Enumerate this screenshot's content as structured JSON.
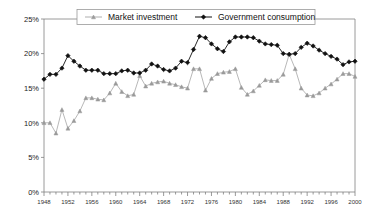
{
  "chart_data": {
    "type": "line",
    "title": "",
    "xlabel": "",
    "ylabel": "",
    "ylim": [
      0,
      25
    ],
    "xlim": [
      1948,
      2000
    ],
    "grid": false,
    "legend_position": "top-center",
    "ytick_labels": [
      "0%",
      "5%",
      "10%",
      "15%",
      "20%",
      "25%"
    ],
    "ytick_values": [
      0,
      5,
      10,
      15,
      20,
      25
    ],
    "xtick_labels": [
      "1948",
      "1952",
      "1956",
      "1960",
      "1964",
      "1968",
      "1972",
      "1976",
      "1980",
      "1984",
      "1988",
      "1992",
      "1996",
      "2000"
    ],
    "xtick_values": [
      1948,
      1952,
      1956,
      1960,
      1964,
      1968,
      1972,
      1976,
      1980,
      1984,
      1988,
      1992,
      1996,
      2000
    ],
    "x": [
      1948,
      1949,
      1950,
      1951,
      1952,
      1953,
      1954,
      1955,
      1956,
      1957,
      1958,
      1959,
      1960,
      1961,
      1962,
      1963,
      1964,
      1965,
      1966,
      1967,
      1968,
      1969,
      1970,
      1971,
      1972,
      1973,
      1974,
      1975,
      1976,
      1977,
      1978,
      1979,
      1980,
      1981,
      1982,
      1983,
      1984,
      1985,
      1986,
      1987,
      1988,
      1989,
      1990,
      1991,
      1992,
      1993,
      1994,
      1995,
      1996,
      1997,
      1998,
      1999,
      2000
    ],
    "series": [
      {
        "name": "Market investment",
        "marker": "triangle",
        "color": "#9a9a9a",
        "values": [
          10.0,
          10.0,
          8.5,
          11.9,
          9.2,
          10.3,
          11.7,
          13.6,
          13.6,
          13.4,
          13.3,
          14.3,
          15.7,
          14.5,
          13.9,
          14.1,
          16.8,
          15.3,
          15.7,
          15.9,
          16.0,
          15.7,
          15.5,
          15.2,
          15.0,
          17.8,
          17.8,
          14.7,
          16.4,
          17.1,
          17.3,
          17.4,
          17.8,
          15.1,
          14.1,
          14.6,
          15.4,
          16.2,
          16.1,
          16.1,
          17.0,
          19.9,
          17.8,
          15.0,
          14.0,
          13.9,
          14.3,
          15.0,
          15.6,
          16.3,
          17.1,
          17.1,
          16.7
        ]
      },
      {
        "name": "Government consumption",
        "marker": "diamond",
        "color": "#111111",
        "values": [
          16.3,
          17.0,
          17.0,
          17.9,
          19.7,
          18.9,
          18.2,
          17.6,
          17.6,
          17.6,
          17.1,
          17.1,
          17.1,
          17.5,
          17.6,
          17.2,
          17.2,
          17.6,
          18.5,
          18.2,
          17.7,
          17.5,
          17.9,
          18.9,
          18.7,
          20.6,
          22.5,
          22.3,
          21.4,
          20.7,
          20.3,
          21.7,
          22.4,
          22.4,
          22.4,
          22.3,
          21.8,
          21.4,
          21.3,
          21.2,
          20.0,
          19.9,
          20.0,
          20.9,
          21.5,
          21.1,
          20.5,
          20.0,
          19.6,
          19.2,
          18.4,
          18.8,
          18.9
        ]
      }
    ]
  },
  "legend": {
    "items": [
      {
        "label": "Market investment"
      },
      {
        "label": "Government consumption"
      }
    ]
  }
}
